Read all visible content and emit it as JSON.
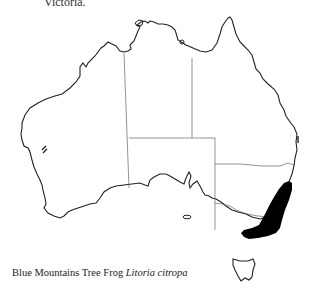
{
  "header_fragment": "Victoria.",
  "map": {
    "region": "Australia",
    "states": [
      "Western Australia",
      "Northern Territory",
      "South Australia",
      "Queensland",
      "New South Wales",
      "Victoria",
      "Tasmania"
    ],
    "highlight_color": "#000000",
    "outline_color": "#222222",
    "border_color": "#666666",
    "distribution_area": "South-east coast and ranges of New South Wales into eastern Victoria"
  },
  "caption": {
    "common_name": "Blue Mountains Tree Frog",
    "scientific_name": "Litoria citropa"
  }
}
